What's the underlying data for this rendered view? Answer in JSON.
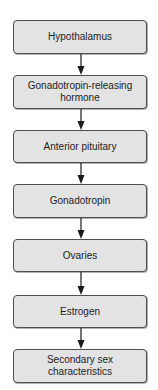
{
  "diagram": {
    "type": "flowchart",
    "direction": "top-to-bottom",
    "colors": {
      "box_fill": "#e3e3e3",
      "box_border": "#4f4f4f",
      "text": "#222222",
      "arrow": "#1a1a1a",
      "background": "#ffffff"
    },
    "nodes": [
      {
        "label": "Hypothalamus"
      },
      {
        "label": "Gonadotropin-releasing hormone",
        "line1": "Gonadotropin-releasing",
        "line2": "hormone"
      },
      {
        "label": "Anterior pituitary"
      },
      {
        "label": "Gonadotropin"
      },
      {
        "label": "Ovaries"
      },
      {
        "label": "Estrogen"
      },
      {
        "label": "Secondary sex characteristics",
        "line1": "Secondary sex",
        "line2": "characteristics"
      }
    ],
    "edges": [
      {
        "from": "Hypothalamus",
        "to": "Gonadotropin-releasing hormone"
      },
      {
        "from": "Gonadotropin-releasing hormone",
        "to": "Anterior pituitary"
      },
      {
        "from": "Anterior pituitary",
        "to": "Gonadotropin"
      },
      {
        "from": "Gonadotropin",
        "to": "Ovaries"
      },
      {
        "from": "Ovaries",
        "to": "Estrogen"
      },
      {
        "from": "Estrogen",
        "to": "Secondary sex characteristics"
      }
    ]
  }
}
